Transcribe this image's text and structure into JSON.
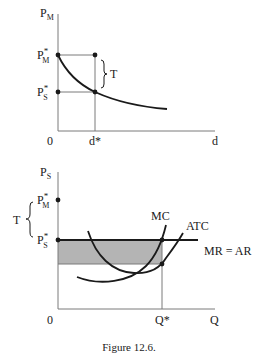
{
  "figure": {
    "caption": "Figure 12.6."
  },
  "top_chart": {
    "y_axis_label": "P",
    "y_axis_label_sub": "M",
    "x_axis_label": "d",
    "origin_label": "0",
    "y_ticks": [
      {
        "main": "P",
        "sub": "M",
        "sup": "*"
      },
      {
        "main": "P",
        "sub": "S",
        "sup": "*"
      }
    ],
    "x_ticks": [
      {
        "label": "d*"
      }
    ],
    "brace_label": "T",
    "curve": "downward-sloping demand curve through (d*, P*S) starting at P*M"
  },
  "bottom_chart": {
    "y_axis_label": "P",
    "y_axis_label_sub": "S",
    "x_axis_label": "Q",
    "origin_label": "0",
    "y_ticks": [
      {
        "main": "P",
        "sub": "M",
        "sup": "*"
      },
      {
        "main": "P",
        "sub": "S",
        "sup": "*"
      }
    ],
    "x_ticks": [
      {
        "label": "Q*"
      }
    ],
    "brace_label": "T",
    "curve_labels": {
      "mc": "MC",
      "atc": "ATC",
      "mr": "MR = AR"
    },
    "shaded_region": "profit rectangle between P*S and ATC at Q*",
    "colors": {
      "shade": "#b4b4b4",
      "line": "#1a1a1a",
      "axis": "#7a7a7a"
    }
  }
}
